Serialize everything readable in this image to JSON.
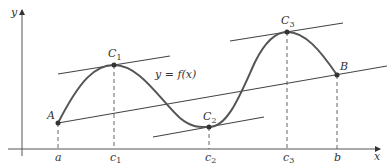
{
  "diagram": {
    "axes": {
      "x_label": "x",
      "y_label": "y"
    },
    "curve_label": "y = f(x)",
    "points": [
      {
        "name": "A",
        "label": "A",
        "x": 58,
        "y": 123
      },
      {
        "name": "C1",
        "label": "C",
        "sub": "1",
        "x": 114,
        "y": 65
      },
      {
        "name": "C2",
        "label": "C",
        "sub": "2",
        "x": 209,
        "y": 127
      },
      {
        "name": "C3",
        "label": "C",
        "sub": "3",
        "x": 287,
        "y": 32
      },
      {
        "name": "B",
        "label": "B",
        "x": 337,
        "y": 75
      }
    ],
    "x_ticks": [
      {
        "label": "a",
        "sub": "",
        "x": 58
      },
      {
        "label": "c",
        "sub": "1",
        "x": 114
      },
      {
        "label": "c",
        "sub": "2",
        "x": 209
      },
      {
        "label": "c",
        "sub": "3",
        "x": 287
      },
      {
        "label": "b",
        "sub": "",
        "x": 337
      }
    ],
    "colors": {
      "curve": "#555555",
      "lines": "#444444",
      "points": "#333333"
    }
  }
}
